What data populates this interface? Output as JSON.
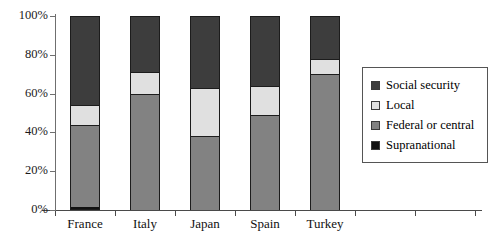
{
  "chart_data": {
    "type": "bar",
    "subtype": "stacked-bar-100-percent",
    "title": "",
    "xlabel": "",
    "ylabel": "",
    "ylim": [
      0,
      100
    ],
    "yticks": [
      "0%",
      "20%",
      "40%",
      "60%",
      "80%",
      "100%"
    ],
    "ytick_values": [
      0,
      20,
      40,
      60,
      80,
      100
    ],
    "grid": false,
    "legend_position": "right",
    "categories": [
      "France",
      "Italy",
      "Japan",
      "Spain",
      "Turkey"
    ],
    "series": [
      {
        "name": "Supranational",
        "color": "#111111",
        "values": [
          1.5,
          0,
          0,
          0,
          0
        ]
      },
      {
        "name": "Federal or central",
        "color": "#828282",
        "values": [
          42.5,
          60,
          38,
          49,
          70
        ]
      },
      {
        "name": "Local",
        "color": "#e0e0e0",
        "values": [
          10,
          11,
          25,
          15,
          8
        ]
      },
      {
        "name": "Social security",
        "color": "#3d3d3d",
        "values": [
          46,
          29,
          37,
          36,
          22
        ]
      }
    ],
    "stack_order_bottom_to_top": [
      "Supranational",
      "Federal or central",
      "Local",
      "Social security"
    ],
    "legend_entries": [
      {
        "label": "Social security",
        "color": "#3d3d3d"
      },
      {
        "label": "Local",
        "color": "#e0e0e0"
      },
      {
        "label": "Federal or central",
        "color": "#828282"
      },
      {
        "label": "Supranational",
        "color": "#111111"
      }
    ]
  }
}
